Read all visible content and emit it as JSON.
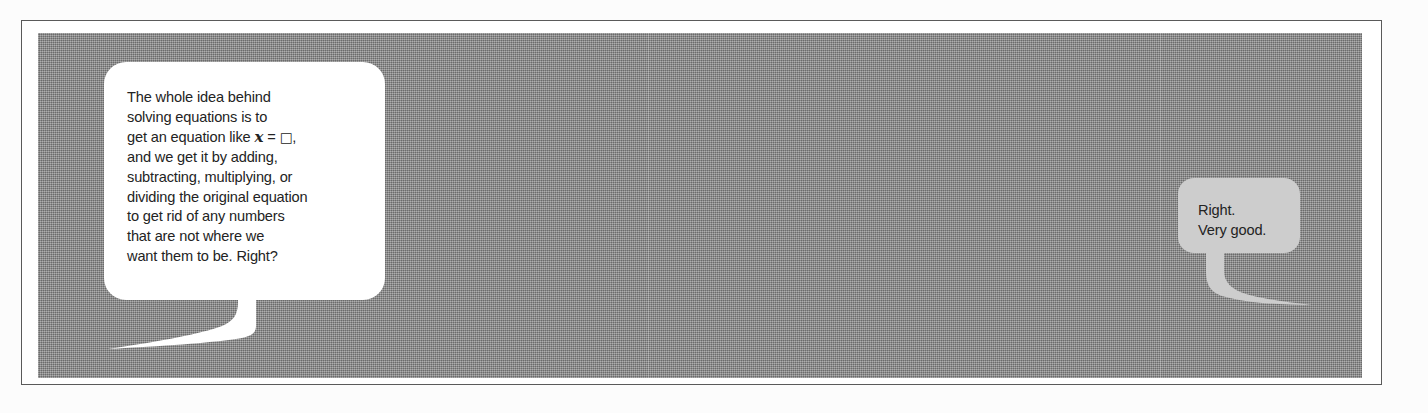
{
  "scene": {
    "width": 1428,
    "height": 413,
    "page_background": "#fcfcfc",
    "panel_color": "#8d8d8d",
    "frame_border_color": "#5a5a5a"
  },
  "bubbles": [
    {
      "id": "left",
      "speaker_side": "left",
      "fill": "#ffffff",
      "text_color": "#232323",
      "tail_direction": "down-left",
      "lines": [
        "The whole idea behind",
        "solving equations is to",
        "get an equation like ",
        "and we get it by adding,",
        "subtracting, multiplying, or",
        "dividing the original equation",
        "to get rid of any numbers",
        "that are not where we",
        "want them to be. Right?"
      ],
      "math_line": {
        "prefix": "get an equation like ",
        "variable": "x",
        "operator": " = ",
        "placeholder": "□",
        "suffix": ","
      },
      "full_text": "The whole idea behind solving equations is to get an equation like x = □, and we get it by adding, subtracting, multiplying, or dividing the original equation to get rid of any numbers that are not where we want them to be. Right?"
    },
    {
      "id": "right",
      "speaker_side": "right",
      "fill": "#cdcdcd",
      "text_color": "#232323",
      "tail_direction": "down-right",
      "lines": [
        "Right.",
        "Very good."
      ],
      "full_text": "Right. Very good."
    }
  ]
}
